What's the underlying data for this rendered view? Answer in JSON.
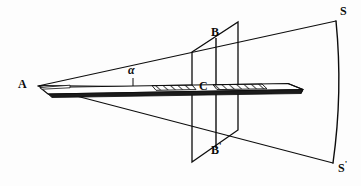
{
  "figure": {
    "caption": "",
    "background_color": "#fdfdfd",
    "stroke_color": "#0d0d0d",
    "hatch_color": "#111111",
    "width": 361,
    "height": 186
  },
  "labels": {
    "apex": "A",
    "cone_top_on_plane": "B",
    "cone_bottom_on_plane": "B",
    "cone_bottom_prime": "'",
    "axis_center": "C",
    "screen_top": "S",
    "screen_bottom": "S",
    "screen_bottom_prime": "'",
    "angle": "α"
  },
  "geometry": {
    "apex_point": [
      38,
      86
    ],
    "axis_line": [
      [
        38,
        86
      ],
      [
        303,
        90
      ]
    ],
    "cone_upper_edge": [
      [
        38,
        86
      ],
      [
        336,
        21
      ]
    ],
    "cone_lower_edge": [
      [
        38,
        86
      ],
      [
        333,
        163
      ]
    ],
    "plane_corners": [
      [
        192,
        52
      ],
      [
        238,
        22
      ],
      [
        238,
        130
      ],
      [
        192,
        162
      ]
    ],
    "plane_vertical_BBprime": [
      [
        216,
        38
      ],
      [
        216,
        148
      ]
    ],
    "screen_arc_top": [
      336,
      21
    ],
    "screen_arc_bottom": [
      333,
      163
    ],
    "screen_arc_bulge_x": 343,
    "rod_left_tip": [
      40,
      88
    ],
    "rod_right_tip": [
      303,
      90
    ],
    "angle_tick": [
      [
        133,
        84
      ],
      [
        133,
        95
      ]
    ]
  },
  "elements": {
    "rod_name": "wedge-rod",
    "plane_name": "intersecting-plane",
    "screen_name": "curved-screen",
    "cone_name": "light-cone"
  }
}
